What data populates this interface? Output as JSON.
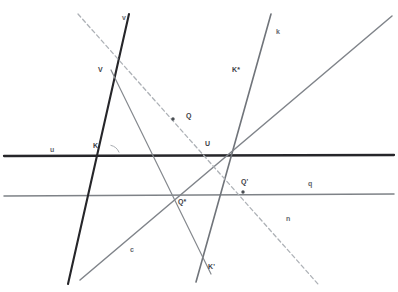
{
  "canvas": {
    "width": 398,
    "height": 292,
    "background": "#ffffff",
    "title": "Projective geometry construction with lines u, q, v, k, c, n"
  },
  "palette": {
    "thick_black": "#26262a",
    "medium_gray": "#6e7277",
    "light_gray": "#8b8f94",
    "dashed_gray": "#a8acb1",
    "label_dark": "#3c4045",
    "label_gray": "#63676c",
    "point_fill": "#4a4e53"
  },
  "lines": [
    {
      "id": "line-u",
      "label": "u",
      "label_x": 50,
      "label_y": 146,
      "x1": 4,
      "y1": 156,
      "x2": 394,
      "y2": 155,
      "color": "#26262a",
      "width": 2.3,
      "dash": "none",
      "role": "horizontal-baseline"
    },
    {
      "id": "line-q",
      "label": "q",
      "label_x": 308,
      "label_y": 180,
      "x1": 4,
      "y1": 196,
      "x2": 394,
      "y2": 194,
      "color": "#7e8287",
      "width": 1.5,
      "dash": "none",
      "role": "horizontal-secondary"
    },
    {
      "id": "line-v",
      "label": "v",
      "label_x": 122,
      "label_y": 14,
      "x1": 129,
      "y1": 14,
      "x2": 68,
      "y2": 284,
      "color": "#26262a",
      "width": 2.1,
      "dash": "none",
      "role": "steep-black"
    },
    {
      "id": "line-k",
      "label": "k",
      "label_x": 276,
      "label_y": 28,
      "x1": 271,
      "y1": 14,
      "x2": 196,
      "y2": 282,
      "color": "#70747a",
      "width": 1.6,
      "dash": "none",
      "role": "steep-gray"
    },
    {
      "id": "line-c",
      "label": "c",
      "label_x": 130,
      "label_y": 246,
      "x1": 80,
      "y1": 280,
      "x2": 392,
      "y2": 16,
      "color": "#80848a",
      "width": 1.5,
      "dash": "none",
      "role": "diagonal-rising"
    },
    {
      "id": "line-n",
      "label": "n",
      "label_x": 286,
      "label_y": 215,
      "x1": 78,
      "y1": 14,
      "x2": 318,
      "y2": 284,
      "color": "#aeb2b7",
      "width": 1.3,
      "dash": "4,3",
      "role": "diagonal-dashed"
    },
    {
      "id": "line-vq",
      "label": "",
      "label_x": 0,
      "label_y": 0,
      "x1": 111,
      "y1": 70,
      "x2": 211,
      "y2": 274,
      "color": "#85898e",
      "width": 1.2,
      "dash": "none",
      "role": "ray-through-V-and-Q"
    }
  ],
  "points": [
    {
      "id": "point-V",
      "label": "V",
      "x": 112,
      "y": 72,
      "label_x": 98,
      "label_y": 66,
      "marker": false
    },
    {
      "id": "point-Q",
      "label": "Q",
      "x": 173,
      "y": 119,
      "label_x": 186,
      "label_y": 112,
      "marker": true
    },
    {
      "id": "point-K",
      "label": "K",
      "x": 107,
      "y": 156,
      "label_x": 93,
      "label_y": 142,
      "marker": false
    },
    {
      "id": "point-U",
      "label": "U",
      "x": 209,
      "y": 153,
      "label_x": 205,
      "label_y": 140,
      "marker": false
    },
    {
      "id": "point-Qs",
      "label": "Q*",
      "x": 173,
      "y": 196,
      "label_x": 178,
      "label_y": 198,
      "marker": false
    },
    {
      "id": "point-Qp",
      "label": "Q'",
      "x": 243,
      "y": 192,
      "label_x": 241,
      "label_y": 178,
      "marker": true
    },
    {
      "id": "point-Ks",
      "label": "K*",
      "x": 246,
      "y": 80,
      "label_x": 232,
      "label_y": 66,
      "marker": false
    },
    {
      "id": "point-Kp",
      "label": "K'",
      "x": 200,
      "y": 266,
      "label_x": 208,
      "label_y": 263,
      "marker": false
    }
  ],
  "angle_marker": {
    "id": "angle-at-K",
    "cx": 108,
    "cy": 157,
    "radius": 12,
    "start_deg": -78,
    "end_deg": -22,
    "color": "#a8acb1",
    "label": "",
    "label_x": 116,
    "label_y": 145
  }
}
